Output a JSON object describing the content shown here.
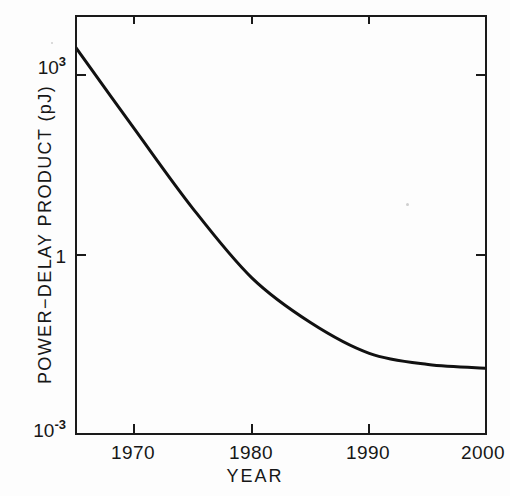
{
  "chart_data": {
    "type": "line",
    "title": "",
    "xlabel": "YEAR",
    "ylabel": "POWER-DELAY PRODUCT (pJ)",
    "xlim": [
      1965,
      2000
    ],
    "ylim": [
      0.001,
      10000
    ],
    "yscale": "log",
    "xscale": "linear",
    "grid": false,
    "legend": null,
    "xticks": [
      1970,
      1980,
      1990,
      2000
    ],
    "xtick_labels": [
      "1970",
      "1980",
      "1990",
      "2000"
    ],
    "yticks": [
      1000,
      1,
      0.001
    ],
    "ytick_labels": [
      "10³",
      "1",
      "10⁻³"
    ],
    "ytick_parts": [
      {
        "mantissa": "10",
        "exponent": "3"
      },
      {
        "mantissa": "1",
        "exponent": ""
      },
      {
        "mantissa": "10",
        "exponent": "-3"
      }
    ],
    "series": [
      {
        "name": "Power-delay product",
        "x": [
          1965,
          1970,
          1975,
          1980,
          1985,
          1990,
          1995,
          2000
        ],
        "values": [
          3000,
          130,
          6.0,
          0.42,
          0.075,
          0.023,
          0.015,
          0.013
        ]
      }
    ]
  },
  "axes": {
    "x_title": "YEAR",
    "y_title": "POWER−DELAY PRODUCT (pJ)",
    "x_tick_labels": [
      "1970",
      "1980",
      "1990",
      "2000"
    ],
    "y_tick_labels": [
      "10³",
      "1",
      "10⁻³"
    ]
  },
  "style": {
    "background": "#fdfdfd",
    "ink": "#1a1a1a",
    "curve_color": "#111111"
  }
}
